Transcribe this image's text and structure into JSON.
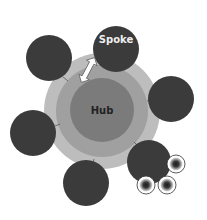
{
  "diagram": {
    "type": "hub-and-spoke",
    "hub": {
      "label": "Hub",
      "color": "#7b7b7b",
      "label_color": "#222222"
    },
    "rings": [
      {
        "name": "outer-ring",
        "color": "#bdbdbd"
      },
      {
        "name": "middle-ring",
        "color": "#a0a0a0"
      }
    ],
    "spokes": [
      {
        "id": "top",
        "label": "Spoke",
        "color": "#3b3b3b",
        "label_color": "#eeeeee"
      },
      {
        "id": "upper-left",
        "label": "",
        "color": "#3b3b3b"
      },
      {
        "id": "right",
        "label": "",
        "color": "#3b3b3b"
      },
      {
        "id": "left",
        "label": "",
        "color": "#3b3b3b"
      },
      {
        "id": "bottom",
        "label": "",
        "color": "#3b3b3b"
      },
      {
        "id": "bottom-right",
        "label": "",
        "color": "#3b3b3b"
      }
    ],
    "sub_nodes": [
      {
        "id": "sub-1",
        "parent": "bottom-right"
      },
      {
        "id": "sub-2",
        "parent": "bottom-right"
      },
      {
        "id": "sub-3",
        "parent": "bottom-right"
      }
    ],
    "connector": {
      "type": "double-arrow",
      "between": [
        "upper-left",
        "hub"
      ]
    }
  }
}
